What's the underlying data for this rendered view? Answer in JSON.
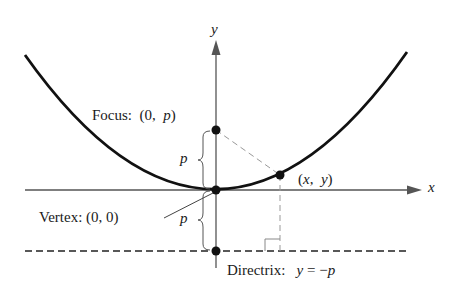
{
  "diagram": {
    "type": "parabola",
    "axes": {
      "x_label": "x",
      "y_label": "y"
    },
    "labels": {
      "focus_prefix": "Focus:",
      "focus_coords_open": "(0,",
      "focus_coords_var": "p",
      "focus_coords_close": ")",
      "vertex": "Vertex:  (0,  0)",
      "point_open": "(",
      "point_x": "x",
      "point_comma": ",",
      "point_y": "y",
      "point_close": ")",
      "directrix_prefix": "Directrix:",
      "directrix_eq_y": "y",
      "directrix_eq_rest": "=  −",
      "directrix_eq_p": "p",
      "p_upper": "p",
      "p_lower": "p"
    },
    "colors": {
      "curve": "#111111",
      "axis": "#555555",
      "dashed": "#888888",
      "point": "#111111"
    }
  }
}
